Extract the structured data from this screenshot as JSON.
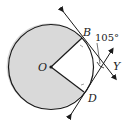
{
  "diagram": {
    "type": "circle-tangents",
    "points": {
      "O": {
        "label": "O"
      },
      "B": {
        "label": "B"
      },
      "D": {
        "label": "D"
      },
      "Y": {
        "label": "Y"
      }
    },
    "angle_label": "105°",
    "colors": {
      "shading": "#d9d9d9",
      "stroke": "#1a1a1a",
      "background": "#ffffff"
    }
  }
}
